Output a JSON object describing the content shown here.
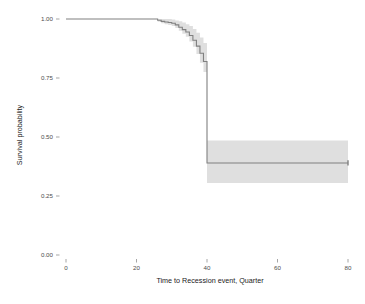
{
  "chart_data": {
    "type": "line",
    "subtype": "kaplan-meier-survival-curve",
    "title": "",
    "subtitle": "",
    "xlabel": "Time to Recession event, Quarter",
    "ylabel": "Survival probability",
    "xlim": [
      -2,
      82
    ],
    "ylim": [
      0.0,
      1.02
    ],
    "xticks": [
      0,
      20,
      40,
      60,
      80
    ],
    "xtick_labels": [
      "0",
      "20",
      "40",
      "60",
      "80"
    ],
    "yticks": [
      0.0,
      0.25,
      0.5,
      0.75,
      1.0
    ],
    "ytick_labels": [
      "0.00",
      "0.25",
      "0.50",
      "0.75",
      "1.00"
    ],
    "grid": false,
    "legend": "none",
    "line_color": "#7f7f7f",
    "band_color": "#d9d9d9",
    "background": "#ffffff",
    "series": [
      {
        "name": "Survival probability",
        "step": "post",
        "x": [
          0,
          25,
          26,
          27,
          28,
          29,
          30,
          31,
          32,
          33,
          34,
          35,
          36,
          37,
          38,
          39,
          40,
          80
        ],
        "y": [
          1.0,
          1.0,
          0.995,
          0.99,
          0.987,
          0.985,
          0.982,
          0.975,
          0.965,
          0.955,
          0.945,
          0.93,
          0.91,
          0.885,
          0.855,
          0.82,
          0.39,
          0.39
        ],
        "ci_lower": [
          1.0,
          1.0,
          0.988,
          0.982,
          0.978,
          0.975,
          0.97,
          0.962,
          0.95,
          0.938,
          0.925,
          0.905,
          0.882,
          0.852,
          0.815,
          0.775,
          0.305,
          0.305
        ],
        "ci_upper": [
          1.0,
          1.0,
          1.0,
          1.0,
          1.0,
          1.0,
          0.998,
          0.994,
          0.99,
          0.985,
          0.978,
          0.97,
          0.958,
          0.942,
          0.922,
          0.898,
          0.485,
          0.485
        ]
      }
    ],
    "censor_marks": [
      {
        "x": 80,
        "y": 0.39
      }
    ],
    "annotations": [
      {
        "text": "Survival stays at 1.00 until quarter 25",
        "x": 12,
        "y": 1.0
      },
      {
        "text": "Sharp drop to 0.39 at quarter 40",
        "x": 40,
        "y": 0.39
      }
    ]
  },
  "axes": {
    "y_title": "Survival probability",
    "x_title": "Time to Recession event, Quarter"
  }
}
